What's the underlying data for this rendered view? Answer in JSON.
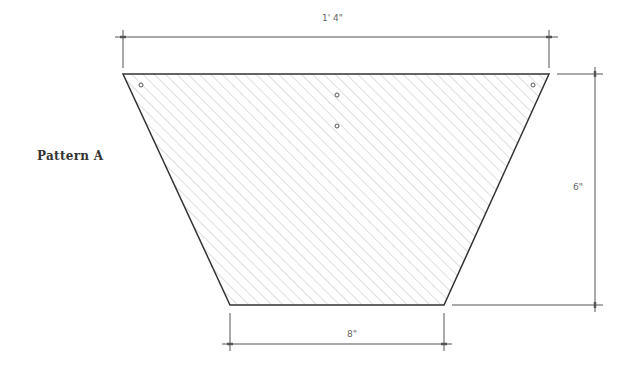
{
  "title": "Pattern A",
  "dimensions": {
    "top_width": "1' 4\"",
    "height": "6\"",
    "bottom_width": "8\""
  },
  "shape": {
    "type": "trapezoid",
    "fill": "diagonal-hatch",
    "stroke_color": "#333333",
    "hatch_color": "#c8c8c8",
    "holes": 5
  }
}
